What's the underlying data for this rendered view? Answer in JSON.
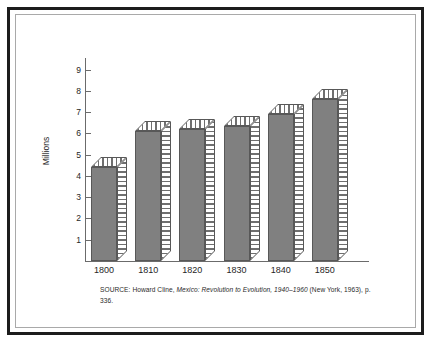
{
  "figure": {
    "frame": {
      "outer_border_color": "#1c1c1c",
      "inner_border_color": "#a9a9a9",
      "background": "#ffffff"
    }
  },
  "source_note": {
    "label": "SOURCE:",
    "author": "Howard Cline,",
    "title_italic": "Mexico: Revolution to Evolution, 1940–1960",
    "publication": "(New York, 1963), p. 336."
  },
  "chart_data": {
    "type": "bar",
    "title": "",
    "subtitle": "",
    "xlabel": "",
    "ylabel": "Millions",
    "categories": [
      "1800",
      "1810",
      "1820",
      "1830",
      "1840",
      "1850"
    ],
    "values": [
      4.4,
      6.1,
      6.2,
      6.35,
      6.9,
      7.6
    ],
    "series": [
      {
        "name": "Population",
        "values": [
          4.4,
          6.1,
          6.2,
          6.35,
          6.9,
          7.6
        ]
      }
    ],
    "ylim": [
      0,
      9.55
    ],
    "yticks": [
      1,
      2,
      3,
      4,
      5,
      6,
      7,
      8,
      9
    ],
    "ytick_labels": [
      "1",
      "2",
      "3",
      "4",
      "5",
      "6",
      "7",
      "8",
      "9"
    ],
    "grid": false,
    "legend": false,
    "legend_position": "none",
    "bar_style": "pseudo-3d",
    "bar_face_color": "#808080",
    "bar_hatch_color": "#6f6f6f",
    "axis_color": "#6b6b6b"
  }
}
